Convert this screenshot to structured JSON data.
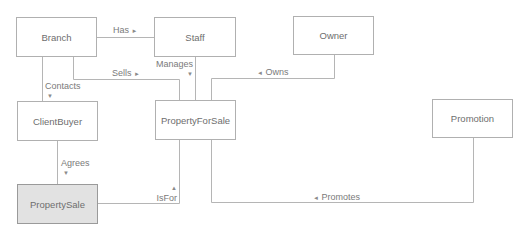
{
  "diagram": {
    "type": "entity-relationship",
    "entities": [
      {
        "id": "branch",
        "label": "Branch",
        "highlighted": false
      },
      {
        "id": "staff",
        "label": "Staff",
        "highlighted": false
      },
      {
        "id": "owner",
        "label": "Owner",
        "highlighted": false
      },
      {
        "id": "clientbuyer",
        "label": "ClientBuyer",
        "highlighted": false
      },
      {
        "id": "propertyforsale",
        "label": "PropertyForSale",
        "highlighted": false
      },
      {
        "id": "promotion",
        "label": "Promotion",
        "highlighted": false
      },
      {
        "id": "propertysale",
        "label": "PropertySale",
        "highlighted": true
      }
    ],
    "relationships": [
      {
        "id": "has",
        "label": "Has",
        "arrow": "►",
        "from": "Branch",
        "to": "Staff"
      },
      {
        "id": "sells",
        "label": "Sells",
        "arrow": "►",
        "from": "Branch",
        "to": "PropertyForSale"
      },
      {
        "id": "contacts",
        "label": "Contacts",
        "arrow": "▼",
        "from": "Branch",
        "to": "ClientBuyer"
      },
      {
        "id": "manages",
        "label": "Manages",
        "arrow": "▼",
        "from": "Staff",
        "to": "PropertyForSale"
      },
      {
        "id": "owns",
        "label": "Owns",
        "arrow": "◄",
        "from": "Owner",
        "to": "PropertyForSale"
      },
      {
        "id": "agrees",
        "label": "Agrees",
        "arrow": "▼",
        "from": "ClientBuyer",
        "to": "PropertySale"
      },
      {
        "id": "isfor",
        "label": "IsFor",
        "arrow": "▲",
        "from": "PropertySale",
        "to": "PropertyForSale"
      },
      {
        "id": "promotes",
        "label": "Promotes",
        "arrow": "◄",
        "from": "Promotion",
        "to": "PropertyForSale"
      }
    ],
    "colors": {
      "border": "#b0b0b0",
      "line": "#b5b5b5",
      "text": "#6e6e6e",
      "highlight_fill": "#e2e2e2"
    }
  }
}
